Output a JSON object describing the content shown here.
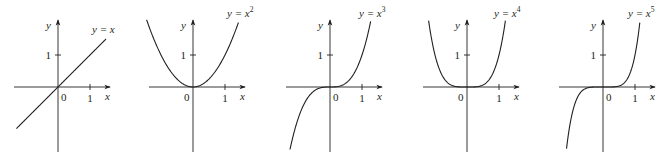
{
  "chart_data": [
    {
      "type": "line",
      "title": "y = x",
      "function": "x",
      "exponent": 1,
      "xlabel": "x",
      "ylabel": "y",
      "tick_labels": {
        "origin": "0",
        "x_tick": "1",
        "y_tick": "1"
      },
      "x_range_drawn": [
        -1.3,
        1.5
      ],
      "x": [
        -1.3,
        -1.0,
        -0.5,
        0,
        0.5,
        1.0,
        1.5
      ],
      "values": [
        -1.3,
        -1.0,
        -0.5,
        0,
        0.5,
        1.0,
        1.5
      ],
      "origin_px": [
        58,
        87
      ],
      "label_pos_px": [
        92,
        33
      ]
    },
    {
      "type": "line",
      "title": "y = x²",
      "function": "x^2",
      "exponent": 2,
      "xlabel": "x",
      "ylabel": "y",
      "tick_labels": {
        "origin": "0",
        "x_tick": "1",
        "y_tick": "1"
      },
      "x_range_drawn": [
        -1.45,
        1.42
      ],
      "x": [
        -1.45,
        -1.0,
        -0.5,
        0,
        0.5,
        1.0,
        1.42
      ],
      "values": [
        2.1,
        1.0,
        0.25,
        0,
        0.25,
        1.0,
        2.02
      ],
      "origin_px": [
        193,
        87
      ],
      "label_pos_px": [
        227,
        17
      ]
    },
    {
      "type": "line",
      "title": "y = x³",
      "function": "x^3",
      "exponent": 3,
      "xlabel": "x",
      "ylabel": "y",
      "tick_labels": {
        "origin": "0",
        "x_tick": "1",
        "y_tick": "1"
      },
      "x_range_drawn": [
        -1.25,
        1.27
      ],
      "x": [
        -1.25,
        -1.0,
        -0.5,
        0,
        0.5,
        1.0,
        1.27
      ],
      "values": [
        -1.95,
        -1.0,
        -0.125,
        0,
        0.125,
        1.0,
        2.05
      ],
      "origin_px": [
        330,
        87
      ],
      "label_pos_px": [
        359,
        17
      ]
    },
    {
      "type": "line",
      "title": "y = x⁴",
      "function": "x^4",
      "exponent": 4,
      "xlabel": "x",
      "ylabel": "y",
      "tick_labels": {
        "origin": "0",
        "x_tick": "1",
        "y_tick": "1"
      },
      "x_range_drawn": [
        -1.2,
        1.2
      ],
      "x": [
        -1.2,
        -1.0,
        -0.5,
        0,
        0.5,
        1.0,
        1.2
      ],
      "values": [
        2.07,
        1.0,
        0.0625,
        0,
        0.0625,
        1.0,
        2.07
      ],
      "origin_px": [
        467,
        87
      ],
      "label_pos_px": [
        494,
        17
      ]
    },
    {
      "type": "line",
      "title": "y = x⁵",
      "function": "x^5",
      "exponent": 5,
      "xlabel": "x",
      "ylabel": "y",
      "tick_labels": {
        "origin": "0",
        "x_tick": "1",
        "y_tick": "1"
      },
      "x_range_drawn": [
        -1.14,
        1.15
      ],
      "x": [
        -1.14,
        -1.0,
        -0.5,
        0,
        0.5,
        1.0,
        1.15
      ],
      "values": [
        -1.93,
        -1.0,
        -0.031,
        0,
        0.031,
        1.0,
        2.01
      ],
      "origin_px": [
        603,
        87
      ],
      "label_pos_px": [
        628,
        17
      ]
    }
  ],
  "layout": {
    "unit_px": 32,
    "grid": false,
    "legend": "none",
    "line_color": "#231f20",
    "background": "#ffffff"
  },
  "labels": {
    "y_axis": "y",
    "x_axis": "x",
    "origin": "0",
    "one": "1",
    "eq": "y = x",
    "base": "y = x"
  }
}
